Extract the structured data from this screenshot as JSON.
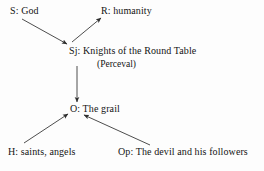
{
  "diagram": {
    "type": "actantial-model",
    "background_color": "#fdfdfd",
    "line_color": "#3a3a3a",
    "text_color": "#141414",
    "nodes": [
      {
        "id": "sender",
        "label": "S: God"
      },
      {
        "id": "receiver",
        "label": "R: humanity"
      },
      {
        "id": "subject",
        "label": "Sj: Knights of the Round Table",
        "sub_label": "(Perceval)"
      },
      {
        "id": "object",
        "label": "O: The grail"
      },
      {
        "id": "helper",
        "label": "H: saints, angels"
      },
      {
        "id": "opponent",
        "label": "Op: The devil and his followers"
      }
    ],
    "arrows": [
      {
        "id": "sender-to-subject",
        "from": "sender",
        "to": "subject",
        "x1": 22,
        "y1": 19,
        "x2": 67,
        "y2": 44
      },
      {
        "id": "subject-to-receiver",
        "from": "subject",
        "to": "receiver",
        "x1": 72,
        "y1": 42,
        "x2": 101,
        "y2": 18
      },
      {
        "id": "subject-to-object",
        "from": "subject",
        "to": "object",
        "x1": 77,
        "y1": 66,
        "x2": 77,
        "y2": 102
      },
      {
        "id": "helper-to-object",
        "from": "helper",
        "to": "object",
        "x1": 24,
        "y1": 143,
        "x2": 68,
        "y2": 114
      },
      {
        "id": "opponent-to-object",
        "from": "opponent",
        "to": "object",
        "x1": 150,
        "y1": 145,
        "x2": 84,
        "y2": 115
      }
    ]
  }
}
